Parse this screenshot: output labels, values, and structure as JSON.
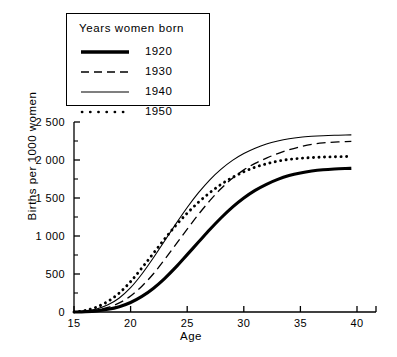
{
  "chart_data": {
    "type": "line",
    "title": "",
    "xlabel": "Age",
    "ylabel": "Births per 1000 women",
    "xlim": [
      15,
      42
    ],
    "ylim": [
      0,
      2500
    ],
    "xticks": [
      15,
      20,
      25,
      30,
      35,
      40
    ],
    "yticks": [
      0,
      500,
      1000,
      1500,
      2000,
      2500
    ],
    "ytick_labels": [
      "0",
      "500",
      "1 000",
      "1 500",
      "2 000",
      "2 500"
    ],
    "minor_ytick_step": 250,
    "grid": false,
    "legend_position": "upper-left",
    "legend_title": "Years women born",
    "x": [
      15,
      16,
      17,
      18,
      19,
      20,
      21,
      22,
      23,
      24,
      25,
      26,
      27,
      28,
      29,
      30,
      31,
      32,
      33,
      34,
      35,
      36,
      37,
      38,
      39,
      39.5
    ],
    "series": [
      {
        "name": "1920",
        "style": "solid-thick",
        "values": [
          0,
          5,
          15,
          35,
          70,
          125,
          205,
          310,
          440,
          590,
          755,
          920,
          1085,
          1240,
          1380,
          1500,
          1600,
          1680,
          1745,
          1795,
          1830,
          1855,
          1872,
          1882,
          1888,
          1890
        ]
      },
      {
        "name": "1930",
        "style": "dashed",
        "values": [
          0,
          8,
          25,
          60,
          120,
          210,
          340,
          500,
          690,
          890,
          1090,
          1285,
          1465,
          1625,
          1760,
          1870,
          1955,
          2025,
          2085,
          2135,
          2175,
          2205,
          2225,
          2235,
          2242,
          2245
        ]
      },
      {
        "name": "1940",
        "style": "solid-thin",
        "values": [
          0,
          12,
          40,
          95,
          185,
          320,
          500,
          710,
          935,
          1160,
          1375,
          1570,
          1740,
          1880,
          1995,
          2085,
          2155,
          2210,
          2250,
          2280,
          2300,
          2312,
          2320,
          2325,
          2328,
          2330
        ]
      },
      {
        "name": "1950",
        "style": "dotted",
        "values": [
          0,
          20,
          65,
          140,
          250,
          400,
          580,
          770,
          960,
          1140,
          1300,
          1445,
          1570,
          1680,
          1770,
          1845,
          1905,
          1950,
          1985,
          2008,
          2022,
          2032,
          2038,
          2042,
          2045,
          2046
        ]
      }
    ]
  },
  "legend": {
    "title": "Years women born",
    "entries": [
      {
        "label": "1920",
        "style": "solid-thick"
      },
      {
        "label": "1930",
        "style": "dashed"
      },
      {
        "label": "1940",
        "style": "solid-thin"
      },
      {
        "label": "1950",
        "style": "dotted"
      }
    ]
  },
  "axes": {
    "x_title": "Age",
    "y_title": "Births per 1000 women",
    "x_tick_labels": [
      "15",
      "20",
      "25",
      "30",
      "35",
      "40"
    ],
    "y_tick_labels": [
      "0",
      "500",
      "1 000",
      "1 500",
      "2 000",
      "2 500"
    ]
  },
  "colors": {
    "line": "#000000",
    "background": "#ffffff",
    "axis": "#000000"
  }
}
